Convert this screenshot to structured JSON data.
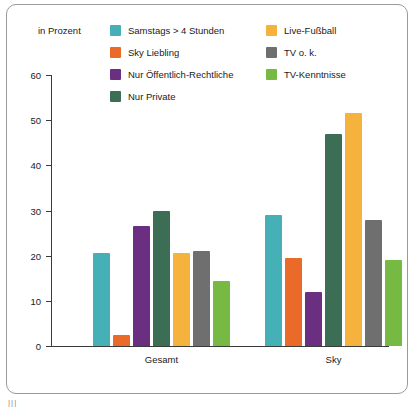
{
  "chart_data": {
    "type": "bar",
    "title": "",
    "subtitle": "",
    "unit_note": "in Prozent",
    "xlabel": "",
    "ylabel": "",
    "ylim": [
      0,
      60
    ],
    "yticks": [
      0,
      10,
      20,
      30,
      40,
      50,
      60
    ],
    "grid": false,
    "legend_position": "top",
    "categories": [
      "Gesamt",
      "Sky"
    ],
    "series": [
      {
        "name": "Samstags > 4 Stunden",
        "color": "#45b0b5",
        "values": [
          20.5,
          29
        ]
      },
      {
        "name": "Sky Liebling",
        "color": "#ea6a2a",
        "values": [
          2.5,
          19.5
        ]
      },
      {
        "name": "Nur Öffentlich-Rechtliche",
        "color": "#6b2f82",
        "values": [
          26.5,
          12
        ]
      },
      {
        "name": "Nur Private",
        "color": "#3c6e55",
        "values": [
          30,
          47
        ]
      },
      {
        "name": "Live-Fußball",
        "color": "#f5b23c",
        "values": [
          20.5,
          51.5
        ]
      },
      {
        "name": "TV o. k.",
        "color": "#6f6f6f",
        "values": [
          21,
          28
        ]
      },
      {
        "name": "TV-Kenntnisse",
        "color": "#76b943",
        "values": [
          14.5,
          19
        ]
      }
    ]
  },
  "legend": {
    "column1": [
      {
        "label": "Samstags > 4 Stunden",
        "color": "#45b0b5"
      },
      {
        "label": "Sky Liebling",
        "color": "#ea6a2a"
      },
      {
        "label": "Nur Öffentlich-Rechtliche",
        "color": "#6b2f82"
      },
      {
        "label": "Nur Private",
        "color": "#3c6e55"
      }
    ],
    "column2": [
      {
        "label": "Live-Fußball",
        "color": "#f5b23c"
      },
      {
        "label": "TV o. k.",
        "color": "#6f6f6f"
      },
      {
        "label": "TV-Kenntnisse",
        "color": "#76b943"
      }
    ]
  },
  "footer": {
    "mark": "|||"
  }
}
